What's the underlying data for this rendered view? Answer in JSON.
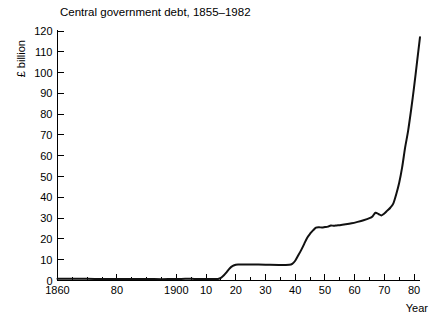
{
  "chart_data": {
    "type": "line",
    "title": "Central government debt, 1855–1982",
    "xlabel": "Year",
    "ylabel": "£ billion",
    "xlim": [
      1860,
      1982
    ],
    "ylim": [
      0,
      120
    ],
    "grid": false,
    "legend": "none",
    "y_ticks": [
      0,
      10,
      20,
      30,
      40,
      50,
      60,
      70,
      80,
      90,
      100,
      110,
      120
    ],
    "y_tick_labels": [
      "0",
      "10",
      "20",
      "30",
      "40",
      "50",
      "60",
      "70",
      "80",
      "90",
      "100",
      "110",
      "120"
    ],
    "y_minor_step": 10,
    "x_major_ticks": [
      1860,
      1880,
      1900,
      1910,
      1920,
      1930,
      1940,
      1950,
      1960,
      1970,
      1980
    ],
    "x_tick_labels": [
      "1860",
      "80",
      "1900",
      "10",
      "20",
      "30",
      "40",
      "50",
      "60",
      "70",
      "80"
    ],
    "x_minor_step": 5,
    "series": [
      {
        "name": "Central government debt",
        "x": [
          1860,
          1865,
          1870,
          1875,
          1880,
          1885,
          1890,
          1895,
          1900,
          1903,
          1906,
          1910,
          1913,
          1914,
          1915,
          1916,
          1917,
          1918,
          1919,
          1920,
          1921,
          1925,
          1930,
          1935,
          1938,
          1939,
          1940,
          1941,
          1942,
          1943,
          1944,
          1945,
          1946,
          1947,
          1948,
          1949,
          1950,
          1951,
          1952,
          1953,
          1954,
          1955,
          1957,
          1959,
          1961,
          1963,
          1965,
          1966,
          1967,
          1968,
          1969,
          1970,
          1971,
          1972,
          1973,
          1974,
          1975,
          1976,
          1977,
          1978,
          1979,
          1980,
          1981,
          1982
        ],
        "y": [
          0.8,
          0.8,
          0.8,
          0.75,
          0.75,
          0.7,
          0.7,
          0.65,
          0.7,
          0.8,
          0.78,
          0.75,
          0.72,
          0.75,
          1.3,
          2.5,
          4.2,
          5.9,
          7.0,
          7.6,
          7.7,
          7.7,
          7.6,
          7.5,
          7.6,
          8.0,
          9.5,
          12.0,
          14.6,
          17.5,
          20.5,
          22.5,
          24.1,
          25.4,
          25.6,
          25.5,
          25.7,
          25.9,
          26.5,
          26.3,
          26.5,
          26.6,
          27.0,
          27.5,
          28.2,
          29.0,
          30.0,
          30.8,
          32.6,
          32.0,
          31.3,
          32.2,
          33.6,
          35.0,
          37.0,
          41.5,
          47.0,
          54.5,
          64.0,
          72.0,
          82.0,
          93.0,
          105.0,
          117.0
        ]
      }
    ]
  },
  "axis": {
    "x_axis_title": "Year",
    "y_axis_title": "£ billion"
  }
}
